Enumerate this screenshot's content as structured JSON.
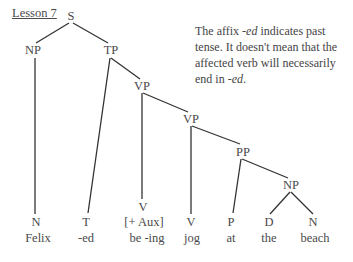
{
  "lesson_label": "Lesson 7",
  "note": {
    "part1": "The affix ",
    "affix1": "-ed",
    "part2": " indicates past tense. It doesn't mean that the affected verb will necessarily end in ",
    "affix2": "-ed",
    "part3": "."
  },
  "tree": {
    "nodes": {
      "S": "S",
      "NP": "NP",
      "TP": "TP",
      "VP1": "VP",
      "VP2": "VP",
      "PP": "PP",
      "NP2": "NP"
    },
    "leaves": [
      {
        "category": "N",
        "word": "Felix"
      },
      {
        "category": "T",
        "word": "-ed"
      },
      {
        "category": "V",
        "feature": "[+ Aux]",
        "word": "be -ing"
      },
      {
        "category": "V",
        "word": "jog"
      },
      {
        "category": "P",
        "word": "at"
      },
      {
        "category": "D",
        "word": "the"
      },
      {
        "category": "N",
        "word": "beach"
      }
    ]
  }
}
